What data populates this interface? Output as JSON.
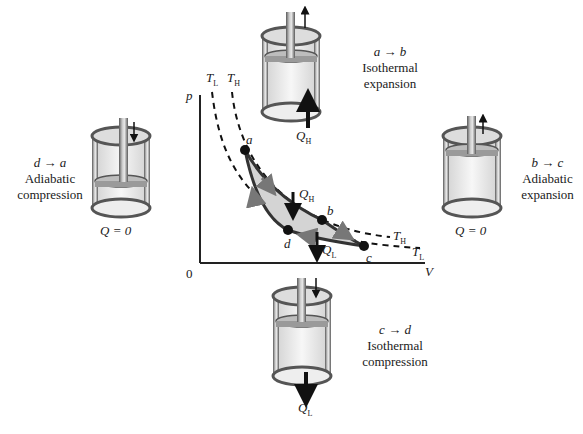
{
  "diagram": {
    "axes": {
      "y_label": "p",
      "x_label": "V",
      "origin": "0"
    },
    "isotherms": [
      {
        "name": "T",
        "sub": "H"
      },
      {
        "name": "T",
        "sub": "L"
      }
    ],
    "points": [
      "a",
      "b",
      "c",
      "d"
    ],
    "heat_labels": {
      "in": {
        "name": "Q",
        "sub": "H"
      },
      "out": {
        "name": "Q",
        "sub": "L"
      }
    },
    "stages": [
      {
        "id": "top",
        "process": "a → b",
        "kind_line1": "Isothermal",
        "kind_line2": "expansion",
        "heat": "Q",
        "heat_sub": "H"
      },
      {
        "id": "right",
        "process": "b → c",
        "kind_line1": "Adiabatic",
        "kind_line2": "expansion",
        "heat": "Q = 0"
      },
      {
        "id": "bottom",
        "process": "c → d",
        "kind_line1": "Isothermal",
        "kind_line2": "compression",
        "heat": "Q",
        "heat_sub": "L"
      },
      {
        "id": "left",
        "process": "d → a",
        "kind_line1": "Adiabatic",
        "kind_line2": "compression",
        "heat": "Q = 0"
      }
    ],
    "colors": {
      "cycle_fill": "#d4d4d4",
      "cycle_stroke": "#333333",
      "cylinder_metal": "#8a8a8a",
      "gas": "#f1f1f1"
    }
  }
}
